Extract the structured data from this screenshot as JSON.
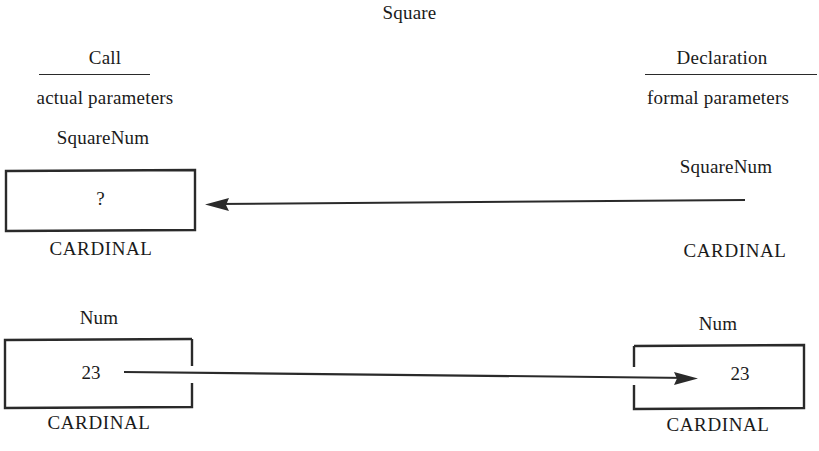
{
  "diagram": {
    "title": "Square",
    "headers": {
      "left": {
        "title": "Call",
        "subtitle": "actual parameters"
      },
      "right": {
        "title": "Declaration",
        "subtitle": "formal parameters"
      }
    },
    "rows": [
      {
        "id": "squarenum",
        "direction": "right-to-left",
        "left": {
          "name": "SquareNum",
          "value": "?",
          "type": "CARDINAL",
          "has_box": true
        },
        "right": {
          "name": "SquareNum",
          "value": "",
          "type": "CARDINAL",
          "has_box": false
        }
      },
      {
        "id": "num",
        "direction": "left-to-right",
        "left": {
          "name": "Num",
          "value": "23",
          "type": "CARDINAL",
          "has_box": true
        },
        "right": {
          "name": "Num",
          "value": "23",
          "type": "CARDINAL",
          "has_box": true
        }
      }
    ],
    "colors": {
      "ink": "#1a1a1a",
      "stroke": "#2a2a2a",
      "background": "#ffffff"
    }
  }
}
